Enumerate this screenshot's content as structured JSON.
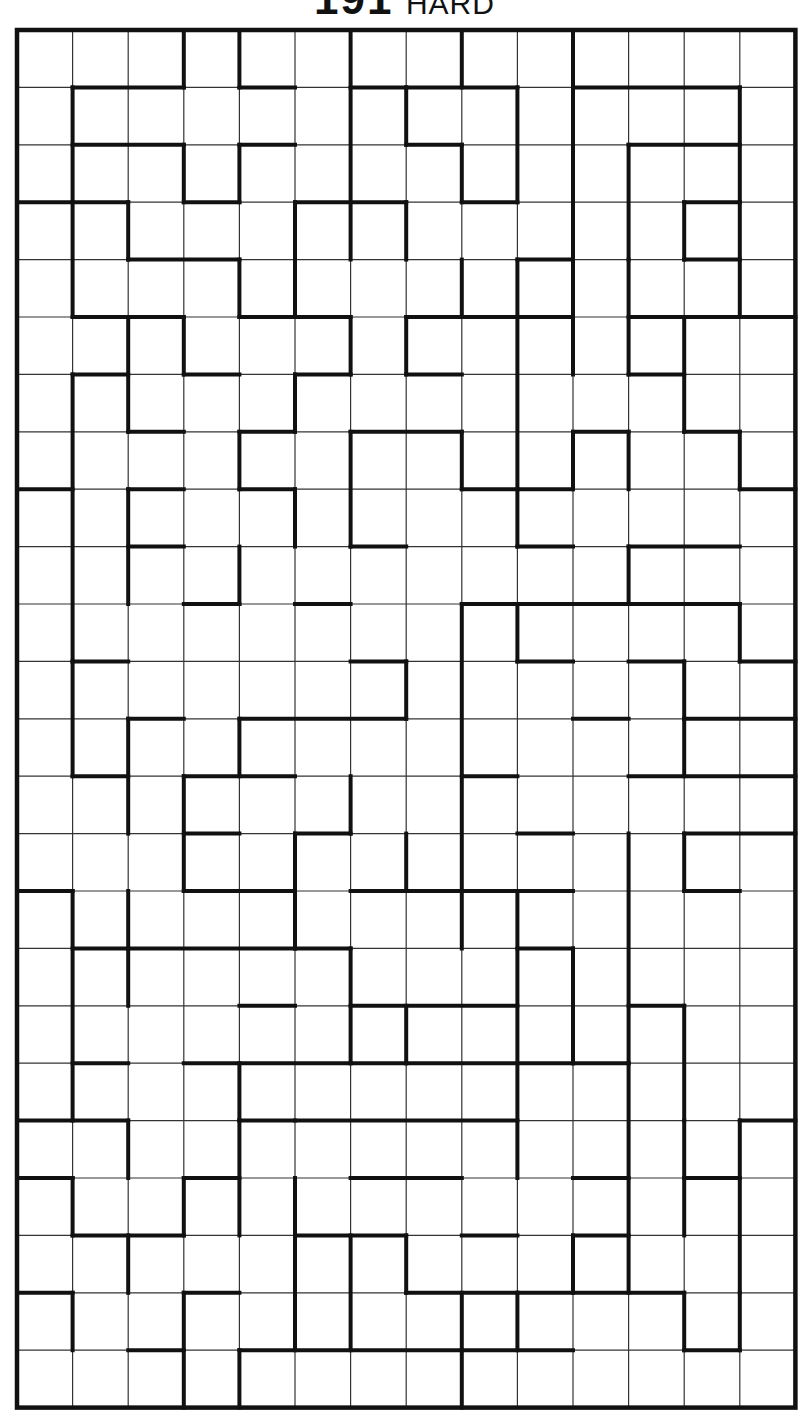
{
  "puzzle": {
    "number": "191",
    "difficulty": "HARD",
    "cols": 14,
    "rows": 24,
    "grid_origin": [
      17,
      30
    ],
    "cell_w": 55.6,
    "cell_h": 57.4,
    "colors": {
      "line": "#111111",
      "thin": "#333333",
      "bg": "#ffffff"
    },
    "h_walls": [
      [
        1,
        1,
        3
      ],
      [
        1,
        4,
        5
      ],
      [
        1,
        6,
        7
      ],
      [
        1,
        7,
        9
      ],
      [
        1,
        10,
        13
      ],
      [
        2,
        1,
        3
      ],
      [
        2,
        4,
        5
      ],
      [
        2,
        7,
        8
      ],
      [
        2,
        11,
        13
      ],
      [
        3,
        0,
        2
      ],
      [
        3,
        3,
        4
      ],
      [
        3,
        5,
        7
      ],
      [
        3,
        8,
        9
      ],
      [
        3,
        12,
        13
      ],
      [
        4,
        2,
        4
      ],
      [
        4,
        9,
        10
      ],
      [
        4,
        12,
        13
      ],
      [
        5,
        1,
        3
      ],
      [
        5,
        4,
        6
      ],
      [
        5,
        7,
        9
      ],
      [
        5,
        9,
        10
      ],
      [
        5,
        11,
        12
      ],
      [
        5,
        12,
        14
      ],
      [
        6,
        1,
        2
      ],
      [
        6,
        3,
        4
      ],
      [
        6,
        5,
        6
      ],
      [
        6,
        7,
        8
      ],
      [
        6,
        11,
        12
      ],
      [
        7,
        2,
        3
      ],
      [
        7,
        4,
        5
      ],
      [
        7,
        6,
        8
      ],
      [
        7,
        10,
        11
      ],
      [
        7,
        12,
        13
      ],
      [
        8,
        0,
        1
      ],
      [
        8,
        2,
        3
      ],
      [
        8,
        4,
        5
      ],
      [
        8,
        8,
        9
      ],
      [
        8,
        9,
        10
      ],
      [
        8,
        13,
        14
      ],
      [
        9,
        2,
        3
      ],
      [
        9,
        6,
        7
      ],
      [
        9,
        9,
        10
      ],
      [
        9,
        11,
        13
      ],
      [
        10,
        3,
        4
      ],
      [
        10,
        5,
        6
      ],
      [
        10,
        8,
        13
      ],
      [
        11,
        1,
        2
      ],
      [
        11,
        6,
        7
      ],
      [
        11,
        9,
        10
      ],
      [
        11,
        11,
        12
      ],
      [
        11,
        13,
        14
      ],
      [
        12,
        2,
        3
      ],
      [
        12,
        4,
        7
      ],
      [
        12,
        10,
        11
      ],
      [
        12,
        12,
        14
      ],
      [
        13,
        1,
        2
      ],
      [
        13,
        3,
        5
      ],
      [
        13,
        8,
        9
      ],
      [
        13,
        11,
        14
      ],
      [
        14,
        3,
        4
      ],
      [
        14,
        5,
        6
      ],
      [
        14,
        9,
        10
      ],
      [
        14,
        12,
        14
      ],
      [
        15,
        0,
        1
      ],
      [
        15,
        3,
        5
      ],
      [
        15,
        6,
        10
      ],
      [
        15,
        12,
        13
      ],
      [
        16,
        1,
        2
      ],
      [
        16,
        2,
        5
      ],
      [
        16,
        5,
        6
      ],
      [
        16,
        9,
        10
      ],
      [
        17,
        4,
        5
      ],
      [
        17,
        6,
        9
      ],
      [
        17,
        11,
        12
      ],
      [
        18,
        1,
        2
      ],
      [
        18,
        3,
        6
      ],
      [
        18,
        6,
        7
      ],
      [
        18,
        7,
        10
      ],
      [
        18,
        10,
        11
      ],
      [
        19,
        0,
        2
      ],
      [
        19,
        4,
        5
      ],
      [
        19,
        5,
        9
      ],
      [
        19,
        13,
        14
      ],
      [
        20,
        0,
        1
      ],
      [
        20,
        3,
        4
      ],
      [
        20,
        6,
        7
      ],
      [
        20,
        7,
        8
      ],
      [
        20,
        10,
        11
      ],
      [
        20,
        12,
        13
      ],
      [
        21,
        1,
        3
      ],
      [
        21,
        5,
        7
      ],
      [
        21,
        8,
        9
      ],
      [
        21,
        10,
        11
      ],
      [
        22,
        0,
        1
      ],
      [
        22,
        3,
        4
      ],
      [
        22,
        7,
        9
      ],
      [
        22,
        9,
        12
      ],
      [
        23,
        2,
        3
      ],
      [
        23,
        4,
        8
      ],
      [
        23,
        8,
        10
      ],
      [
        23,
        12,
        13
      ]
    ],
    "v_walls": [
      [
        1,
        1,
        3
      ],
      [
        1,
        3,
        5
      ],
      [
        1,
        6,
        11
      ],
      [
        1,
        11,
        13
      ],
      [
        1,
        15,
        19
      ],
      [
        1,
        20,
        21
      ],
      [
        1,
        22,
        23
      ],
      [
        2,
        3,
        4
      ],
      [
        2,
        5,
        7
      ],
      [
        2,
        8,
        10
      ],
      [
        2,
        12,
        14
      ],
      [
        2,
        15,
        17
      ],
      [
        2,
        19,
        20
      ],
      [
        2,
        21,
        22
      ],
      [
        3,
        0,
        1
      ],
      [
        3,
        2,
        3
      ],
      [
        3,
        5,
        6
      ],
      [
        3,
        13,
        15
      ],
      [
        3,
        20,
        21
      ],
      [
        3,
        22,
        24
      ],
      [
        4,
        0,
        1
      ],
      [
        4,
        2,
        3
      ],
      [
        4,
        4,
        5
      ],
      [
        4,
        7,
        8
      ],
      [
        4,
        9,
        10
      ],
      [
        4,
        12,
        13
      ],
      [
        4,
        18,
        19
      ],
      [
        4,
        19,
        21
      ],
      [
        4,
        23,
        24
      ],
      [
        5,
        3,
        5
      ],
      [
        5,
        6,
        7
      ],
      [
        5,
        8,
        9
      ],
      [
        5,
        14,
        15
      ],
      [
        5,
        15,
        16
      ],
      [
        5,
        20,
        23
      ],
      [
        6,
        0,
        4
      ],
      [
        6,
        5,
        6
      ],
      [
        6,
        7,
        9
      ],
      [
        6,
        13,
        14
      ],
      [
        6,
        16,
        18
      ],
      [
        6,
        21,
        23
      ],
      [
        7,
        1,
        2
      ],
      [
        7,
        3,
        4
      ],
      [
        7,
        5,
        6
      ],
      [
        7,
        11,
        12
      ],
      [
        7,
        14,
        15
      ],
      [
        7,
        17,
        18
      ],
      [
        7,
        21,
        22
      ],
      [
        8,
        0,
        1
      ],
      [
        8,
        2,
        3
      ],
      [
        8,
        4,
        5
      ],
      [
        8,
        7,
        8
      ],
      [
        8,
        10,
        16
      ],
      [
        8,
        22,
        24
      ],
      [
        9,
        1,
        3
      ],
      [
        9,
        4,
        5
      ],
      [
        9,
        5,
        9
      ],
      [
        9,
        10,
        11
      ],
      [
        9,
        15,
        20
      ],
      [
        9,
        22,
        23
      ],
      [
        10,
        0,
        6
      ],
      [
        10,
        7,
        8
      ],
      [
        10,
        16,
        18
      ],
      [
        10,
        21,
        22
      ],
      [
        11,
        2,
        4
      ],
      [
        11,
        4,
        6
      ],
      [
        11,
        7,
        8
      ],
      [
        11,
        9,
        10
      ],
      [
        11,
        14,
        18
      ],
      [
        11,
        18,
        22
      ],
      [
        12,
        3,
        4
      ],
      [
        12,
        5,
        7
      ],
      [
        12,
        11,
        12
      ],
      [
        12,
        12,
        13
      ],
      [
        12,
        14,
        15
      ],
      [
        12,
        17,
        19
      ],
      [
        12,
        19,
        21
      ],
      [
        12,
        22,
        23
      ],
      [
        13,
        1,
        3
      ],
      [
        13,
        3,
        5
      ],
      [
        13,
        7,
        8
      ],
      [
        13,
        10,
        11
      ],
      [
        13,
        19,
        22
      ],
      [
        13,
        22,
        23
      ]
    ]
  }
}
